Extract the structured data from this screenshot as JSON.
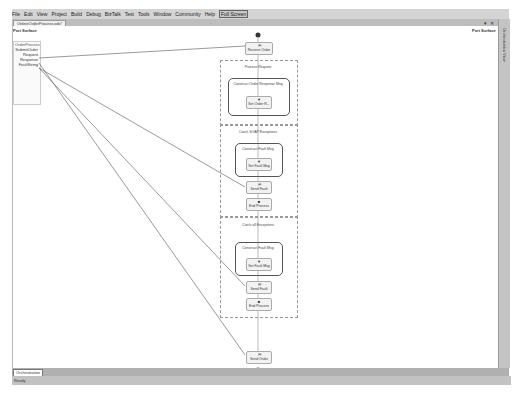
{
  "menubar": {
    "items": [
      "File",
      "Edit",
      "View",
      "Project",
      "Build",
      "Debug",
      "BizTalk",
      "Test",
      "Tools",
      "Window",
      "Community",
      "Help"
    ],
    "full_screen": "Full Screen"
  },
  "document_tab": {
    "label": "OnlineOrderProcess.odx*"
  },
  "window_controls": {
    "dropdown": "▾",
    "close": "✕"
  },
  "left_port_surface": {
    "title": "Port Surface",
    "port_name": "OrderProcess",
    "operation": "SubmitOrder",
    "messages": [
      "Request",
      "Response",
      "FaultString"
    ]
  },
  "right_port_surface": {
    "title": "Port Surface"
  },
  "side_panel": {
    "label": "Orchestration View"
  },
  "orchestration": {
    "receive": "Receive Order",
    "scope": "Process Request",
    "construct_response": "Construct Order Response Msg",
    "set_order": "Set Order R...",
    "catch_soap": "Catch SOAP Exceptions",
    "construct_fault_1": "Construct Fault Msg",
    "set_fault_1": "Set Fault Msg",
    "send_fault_1": "Send Fault",
    "end_process_1": "End Process",
    "catch_all": "Catch all Exceptions",
    "construct_fault_2": "Construct Fault Msg",
    "set_fault_2": "Set Fault Msg",
    "send_fault_2": "Send Fault",
    "end_process_2": "End Process",
    "send_order": "Send Order"
  },
  "bottom_tab": {
    "label": "Orchestration"
  },
  "status": {
    "text": "Ready"
  }
}
